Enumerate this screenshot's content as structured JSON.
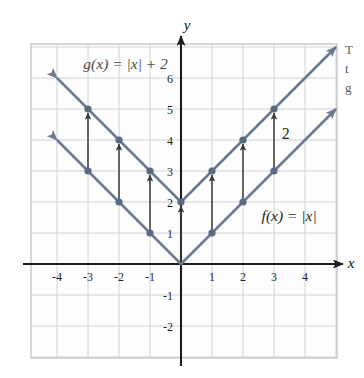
{
  "figure": {
    "kind": "cartesian-plane-graph",
    "background_color": "#fdfdfd",
    "grid_color": "#d2d2d6",
    "frame_color": "#c8c8cc",
    "axis_color": "#1c1c1c",
    "curve_color": "#6b7a8f",
    "point_color": "#5a6a80",
    "arrow_color": "#3a3a3a",
    "label_color": "#4a4a4a",
    "axis_label_x": "x",
    "axis_label_y": "y"
  },
  "labels": {
    "g_label": "g(x) = |x| + 2",
    "f_label": "f(x) = |x|",
    "shift_label": "2"
  },
  "margin_text": {
    "line1": "T",
    "line2": "t",
    "line3": "g"
  },
  "chart_data": {
    "type": "line",
    "title": "",
    "xlabel": "x",
    "ylabel": "y",
    "xlim": [
      -5,
      5
    ],
    "ylim": [
      -3,
      7
    ],
    "grid": true,
    "legend": "inline-labels",
    "xticks": [
      -4,
      -3,
      -2,
      -1,
      1,
      2,
      3,
      4
    ],
    "xtick_labels": [
      "-4",
      "-3",
      "-2",
      "-1",
      "1",
      "2",
      "3",
      "4"
    ],
    "yticks": [
      -2,
      -1,
      1,
      2,
      3,
      4,
      5,
      6
    ],
    "ytick_labels": [
      "-2",
      "-1",
      "1",
      "2",
      "3",
      "4",
      "5",
      "6"
    ],
    "series": [
      {
        "name": "f(x) = |x|",
        "label": "f(x) = |x|",
        "label_x": 2.6,
        "label_y": 1.55,
        "x": [
          -5,
          -4,
          -3,
          -2,
          -1,
          0,
          1,
          2,
          3,
          4,
          5
        ],
        "values": [
          5,
          4,
          3,
          2,
          1,
          0,
          1,
          2,
          3,
          4,
          5
        ],
        "marked_points": [
          {
            "x": -3,
            "y": 3
          },
          {
            "x": -2,
            "y": 2
          },
          {
            "x": -1,
            "y": 1
          },
          {
            "x": 1,
            "y": 1
          },
          {
            "x": 2,
            "y": 2
          },
          {
            "x": 3,
            "y": 3
          }
        ],
        "arrowheads": [
          "start",
          "end"
        ]
      },
      {
        "name": "g(x) = |x| + 2",
        "label": "g(x) = |x| + 2",
        "label_x": -3.15,
        "label_y": 6.45,
        "x": [
          -5,
          -4,
          -3,
          -2,
          -1,
          0,
          1,
          2,
          3,
          4,
          5
        ],
        "values": [
          7,
          6,
          5,
          4,
          3,
          2,
          3,
          4,
          5,
          6,
          7
        ],
        "marked_points": [
          {
            "x": -3,
            "y": 5
          },
          {
            "x": -2,
            "y": 4
          },
          {
            "x": -1,
            "y": 3
          },
          {
            "x": 0,
            "y": 2
          },
          {
            "x": 1,
            "y": 3
          },
          {
            "x": 2,
            "y": 4
          },
          {
            "x": 3,
            "y": 5
          }
        ],
        "arrowheads": [
          "start",
          "end"
        ]
      }
    ],
    "annotations": {
      "shift_arrows": [
        {
          "x": -3,
          "y_from": 3,
          "y_to": 5
        },
        {
          "x": -2,
          "y_from": 2,
          "y_to": 4
        },
        {
          "x": -1,
          "y_from": 1,
          "y_to": 3
        },
        {
          "x": 0,
          "y_from": 0,
          "y_to": 2
        },
        {
          "x": 1,
          "y_from": 1,
          "y_to": 3
        },
        {
          "x": 2,
          "y_from": 2,
          "y_to": 4
        },
        {
          "x": 3,
          "y_from": 3,
          "y_to": 5
        }
      ],
      "shift_amount_label": {
        "text": "2",
        "x": 3.25,
        "y": 4.2
      }
    }
  }
}
